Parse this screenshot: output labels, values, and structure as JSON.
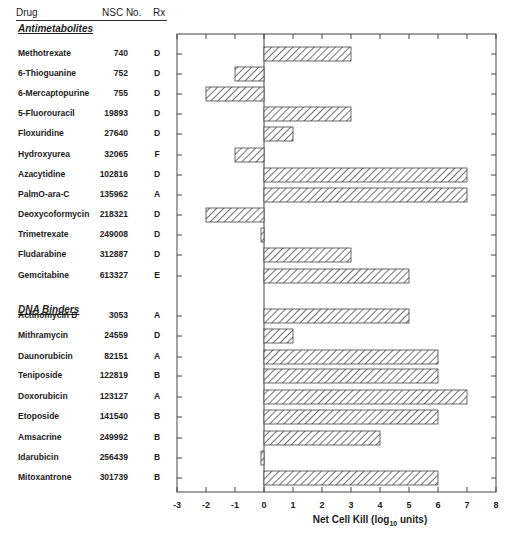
{
  "headers": {
    "drug": "Drug",
    "nsc": "NSC No.",
    "rx": "Rx"
  },
  "categories": [
    {
      "label": "Antimetabolites",
      "y": 10
    },
    {
      "label": "DNA Binders",
      "y": 291
    }
  ],
  "rows": [
    {
      "drug": "Methotrexate",
      "nsc": "740",
      "rx": "D",
      "value": 3,
      "y": 54
    },
    {
      "drug": "6-Thioguanine",
      "nsc": "752",
      "rx": "D",
      "value": -1,
      "y": 74
    },
    {
      "drug": "6-Mercaptopurine",
      "nsc": "755",
      "rx": "D",
      "value": -2,
      "y": 94
    },
    {
      "drug": "5-Fluorouracil",
      "nsc": "19893",
      "rx": "D",
      "value": 3,
      "y": 114
    },
    {
      "drug": "Floxuridine",
      "nsc": "27640",
      "rx": "D",
      "value": 1,
      "y": 134
    },
    {
      "drug": "Hydroxyurea",
      "nsc": "32065",
      "rx": "F",
      "value": -1,
      "y": 155
    },
    {
      "drug": "Azacytidine",
      "nsc": "102816",
      "rx": "D",
      "value": 7,
      "y": 175
    },
    {
      "drug": "PalmO-ara-C",
      "nsc": "135962",
      "rx": "A",
      "value": 7,
      "y": 195
    },
    {
      "drug": "Deoxycoformycin",
      "nsc": "218321",
      "rx": "D",
      "value": -2,
      "y": 215
    },
    {
      "drug": "Trimetrexate",
      "nsc": "249008",
      "rx": "D",
      "value": -0.1,
      "y": 235
    },
    {
      "drug": "Fludarabine",
      "nsc": "312887",
      "rx": "D",
      "value": 3,
      "y": 255
    },
    {
      "drug": "Gemcitabine",
      "nsc": "613327",
      "rx": "E",
      "value": 5,
      "y": 276
    },
    {
      "drug": "Actinomycin D",
      "nsc": "3053",
      "rx": "A",
      "value": 5,
      "y": 316
    },
    {
      "drug": "Mithramycin",
      "nsc": "24559",
      "rx": "D",
      "value": 1,
      "y": 336
    },
    {
      "drug": "Daunorubicin",
      "nsc": "82151",
      "rx": "A",
      "value": 6,
      "y": 357
    },
    {
      "drug": "Teniposide",
      "nsc": "122819",
      "rx": "B",
      "value": 6,
      "y": 376
    },
    {
      "drug": "Doxorubicin",
      "nsc": "123127",
      "rx": "A",
      "value": 7,
      "y": 397
    },
    {
      "drug": "Etoposide",
      "nsc": "141540",
      "rx": "B",
      "value": 6,
      "y": 417
    },
    {
      "drug": "Amsacrine",
      "nsc": "249992",
      "rx": "B",
      "value": 4,
      "y": 438
    },
    {
      "drug": "Idarubicin",
      "nsc": "256439",
      "rx": "B",
      "value": -0.1,
      "y": 458
    },
    {
      "drug": "Mitoxantrone",
      "nsc": "301739",
      "rx": "B",
      "value": 6,
      "y": 478
    }
  ],
  "axis": {
    "xlabel_prefix": "Net Cell Kill (log",
    "xlabel_sub": "10",
    "xlabel_suffix": " units)",
    "ticks": [
      "-3",
      "-2",
      "-1",
      "0",
      "1",
      "2",
      "3",
      "4",
      "5",
      "6",
      "7",
      "8"
    ]
  },
  "chart_data": {
    "type": "bar",
    "orientation": "horizontal",
    "title": "",
    "xlabel": "Net Cell Kill (log10 units)",
    "ylabel": "",
    "xlim": [
      -3,
      8
    ],
    "grid": false,
    "groups": [
      {
        "name": "Antimetabolites",
        "categories": [
          "Methotrexate",
          "6-Thioguanine",
          "6-Mercaptopurine",
          "5-Fluorouracil",
          "Floxuridine",
          "Hydroxyurea",
          "Azacytidine",
          "PalmO-ara-C",
          "Deoxycoformycin",
          "Trimetrexate",
          "Fludarabine",
          "Gemcitabine"
        ],
        "values": [
          3,
          -1,
          -2,
          3,
          1,
          -1,
          7,
          7,
          -2,
          -0.1,
          3,
          5
        ]
      },
      {
        "name": "DNA Binders",
        "categories": [
          "Actinomycin D",
          "Mithramycin",
          "Daunorubicin",
          "Teniposide",
          "Doxorubicin",
          "Etoposide",
          "Amsacrine",
          "Idarubicin",
          "Mitoxantrone"
        ],
        "values": [
          5,
          1,
          6,
          6,
          7,
          6,
          4,
          -0.1,
          6
        ]
      }
    ],
    "table_columns": [
      "Drug",
      "NSC No.",
      "Rx"
    ]
  }
}
